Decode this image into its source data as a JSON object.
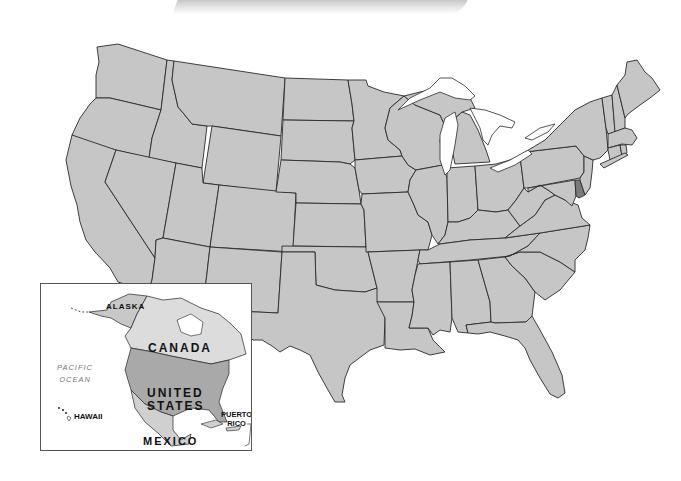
{
  "map": {
    "title": "United States (contiguous) state outline map",
    "colors": {
      "land": "#c6c6c6",
      "highlight_state": "#7a7a7a",
      "border": "#2a2a2a",
      "water": "#ffffff",
      "inset_us": "#a9a9a9",
      "inset_canada": "#dcdcdc",
      "inset_mexico": "#d0d0d0"
    },
    "highlighted_state": "Delaware"
  },
  "inset": {
    "labels": {
      "alaska": "ALASKA",
      "canada": "CANADA",
      "united": "UNITED",
      "states": "STATES",
      "mexico": "MEXICO",
      "hawaii": "HAWAII",
      "puerto": "PUERTO",
      "rico": "RICO",
      "pacific": "PACIFIC",
      "ocean": "OCEAN"
    }
  }
}
